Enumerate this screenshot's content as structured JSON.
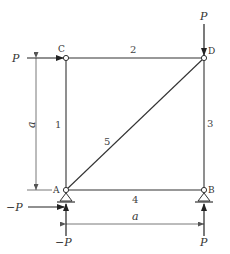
{
  "diagram": {
    "type": "truss",
    "nodes": {
      "A": "A",
      "B": "B",
      "C": "C",
      "D": "D"
    },
    "members": {
      "m1": "1",
      "m2": "2",
      "m3": "3",
      "m4": "4",
      "m5": "5"
    },
    "dimensions": {
      "vertical": "a",
      "horizontal": "a"
    },
    "loads": {
      "c_horizontal": "P",
      "d_vertical": "P",
      "a_horizontal": "−P",
      "a_vertical": "−P",
      "b_vertical": "P"
    },
    "colors": {
      "line": "#333333",
      "background": "#ffffff"
    }
  }
}
